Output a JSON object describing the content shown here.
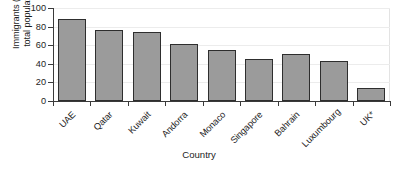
{
  "chart_data": {
    "type": "bar",
    "title": "",
    "xlabel": "Country",
    "ylabel": "Immigrants (% of total population)",
    "ylabel_line1": "Immigrants (% of",
    "ylabel_line2": "total population)",
    "categories": [
      "UAE",
      "Qatar",
      "Kuwait",
      "Andorra",
      "Monaco",
      "Singapore",
      "Bahrain",
      "Luxumbourg",
      "UK*"
    ],
    "values": [
      88,
      76,
      74,
      61,
      55,
      45,
      51,
      43,
      13.5
    ],
    "ylim": [
      0,
      100
    ],
    "yticks": [
      0,
      20,
      40,
      60,
      80,
      100
    ],
    "ytick_labels": [
      "0",
      "20",
      "40",
      "60",
      "80",
      "100"
    ],
    "grid": true,
    "grid_axis": "y",
    "legend": false,
    "bar_color": "#9b9b9b",
    "bar_edge_color": "#2e2e2e",
    "axis_color": "#3a3a3a",
    "grid_color": "#ececec",
    "text_color": "#1d1d1d",
    "background": "#ffffff"
  }
}
